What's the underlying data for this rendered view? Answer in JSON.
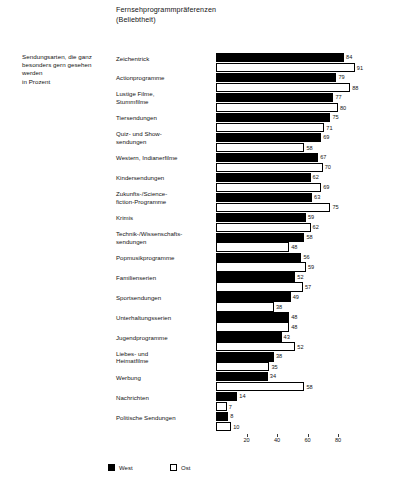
{
  "title": {
    "line1": "Fernsehprogrammpräferenzen",
    "line2": "(Beliebtheit)"
  },
  "caption": {
    "line1": "Sendungsarten, die ganz",
    "line2": "besonders gern gesehen",
    "line3": "werden",
    "line4": "in Prozent"
  },
  "legend": {
    "west_label": "West",
    "ost_label": "Ost",
    "west_color": "#000000",
    "ost_color": "#ffffff"
  },
  "axis": {
    "ticks": [
      "20",
      "40",
      "60",
      "80"
    ],
    "tick_values": [
      20,
      40,
      60,
      80
    ],
    "max": 100
  },
  "chart_data": {
    "type": "bar",
    "orientation": "horizontal",
    "title": "Fernsehprogrammpräferenzen (Beliebtheit)",
    "subtitle": "Sendungsarten, die ganz besonders gern gesehen werden in Prozent",
    "xlabel": "",
    "ylabel": "",
    "xlim": [
      0,
      100
    ],
    "grid": false,
    "legend_position": "bottom-left",
    "categories": [
      "Zeichentrick",
      "Actionprogramme",
      "Lustige Filme, Stummfilme",
      "Tiersendungen",
      "Quiz- und Showsendungen",
      "Western, Indianerfilme",
      "Kindersendungen",
      "Zukunfts-/Science-fiction-Programme",
      "Krimis",
      "Technik-/Wissenschaftssendungen",
      "Popmusikprogramme",
      "Familienserien",
      "Sportsendungen",
      "Unterhaltungsserien",
      "Jugendprogramme",
      "Liebes- und Heimatfilme",
      "Werbung",
      "Nachrichten",
      "Politische Sendungen"
    ],
    "series": [
      {
        "name": "West",
        "color": "#000000",
        "values": [
          84,
          79,
          77,
          75,
          69,
          67,
          62,
          63,
          59,
          58,
          56,
          52,
          49,
          48,
          43,
          38,
          34,
          14,
          8
        ]
      },
      {
        "name": "Ost",
        "color": "#ffffff",
        "values": [
          91,
          88,
          80,
          71,
          58,
          70,
          69,
          75,
          62,
          48,
          59,
          57,
          38,
          48,
          52,
          35,
          58,
          7,
          10
        ]
      }
    ]
  },
  "rows": [
    {
      "label_lines": [
        "Zeichentrick"
      ],
      "west": 84,
      "ost": 91
    },
    {
      "label_lines": [
        "Actionprogramme"
      ],
      "west": 79,
      "ost": 88
    },
    {
      "label_lines": [
        "Lustige Filme,",
        "Stummfilme"
      ],
      "west": 77,
      "ost": 80
    },
    {
      "label_lines": [
        "Tiersendungen"
      ],
      "west": 75,
      "ost": 71
    },
    {
      "label_lines": [
        "Quiz- und Show-",
        "sendungen"
      ],
      "west": 69,
      "ost": 58
    },
    {
      "label_lines": [
        "Western, Indianerfilme"
      ],
      "west": 67,
      "ost": 70
    },
    {
      "label_lines": [
        "Kindersendungen"
      ],
      "west": 62,
      "ost": 69
    },
    {
      "label_lines": [
        "Zukunfts-/Science-",
        "fiction-Programme"
      ],
      "west": 63,
      "ost": 75
    },
    {
      "label_lines": [
        "Krimis"
      ],
      "west": 59,
      "ost": 62
    },
    {
      "label_lines": [
        "Technik-/Wissenschafts-",
        "sendungen"
      ],
      "west": 58,
      "ost": 48
    },
    {
      "label_lines": [
        "Popmusikprogramme"
      ],
      "west": 56,
      "ost": 59
    },
    {
      "label_lines": [
        "Familienserien"
      ],
      "west": 52,
      "ost": 57
    },
    {
      "label_lines": [
        "Sportsendungen"
      ],
      "west": 49,
      "ost": 38
    },
    {
      "label_lines": [
        "Unterhaltungsserien"
      ],
      "west": 48,
      "ost": 48
    },
    {
      "label_lines": [
        "Jugendprogramme"
      ],
      "west": 43,
      "ost": 52
    },
    {
      "label_lines": [
        "Liebes- und",
        "Heimatfilme"
      ],
      "west": 38,
      "ost": 35
    },
    {
      "label_lines": [
        "Werbung"
      ],
      "west": 34,
      "ost": 58
    },
    {
      "label_lines": [
        "Nachrichten"
      ],
      "west": 14,
      "ost": 7
    },
    {
      "label_lines": [
        "Politische Sendungen"
      ],
      "west": 8,
      "ost": 10
    }
  ]
}
